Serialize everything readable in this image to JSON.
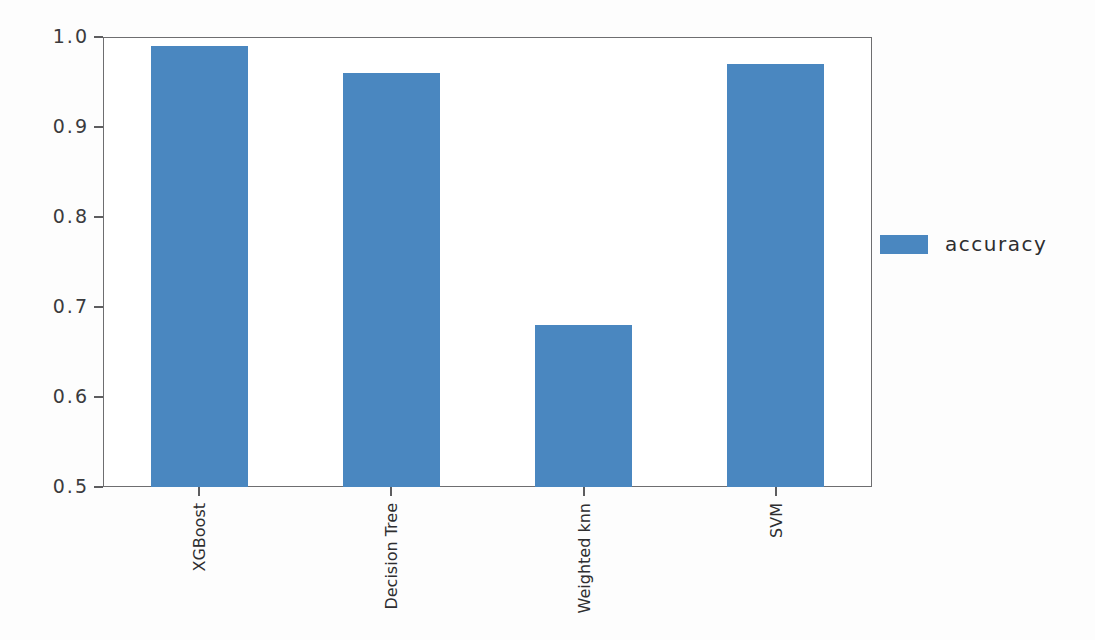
{
  "chart_data": {
    "type": "bar",
    "title": "",
    "xlabel": "",
    "ylabel": "",
    "categories": [
      "XGBoost",
      "Decision Tree",
      "Weighted knn",
      "SVM"
    ],
    "series": [
      {
        "name": "accuracy",
        "values": [
          0.99,
          0.96,
          0.68,
          0.97
        ],
        "color": "#4a87c0"
      }
    ],
    "ylim": [
      0.5,
      1.0
    ],
    "yticks": [
      0.5,
      0.6,
      0.7,
      0.8,
      0.9,
      1.0
    ],
    "ytick_labels": [
      "0.5",
      "0.6",
      "0.7",
      "0.8",
      "0.9",
      "1.0"
    ],
    "xtick_labels": [
      "XGBoost",
      "Decision Tree",
      "Weighted knn",
      "SVM"
    ],
    "grid": false,
    "legend": {
      "position": "right",
      "entries": [
        {
          "label": "accuracy",
          "color": "#4a87c0"
        }
      ]
    }
  },
  "legend": {
    "accuracy_label": "accuracy"
  }
}
